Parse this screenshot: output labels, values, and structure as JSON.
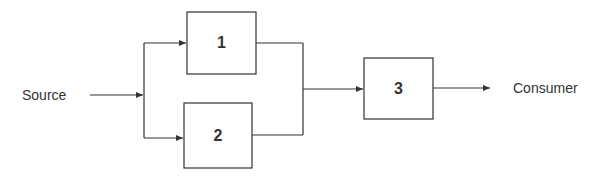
{
  "diagram": {
    "type": "block-diagram",
    "source_label": "Source",
    "consumer_label": "Consumer",
    "blocks": [
      {
        "id": "1",
        "label": "1"
      },
      {
        "id": "2",
        "label": "2"
      },
      {
        "id": "3",
        "label": "3"
      }
    ],
    "edges": [
      {
        "from": "Source",
        "to": "split"
      },
      {
        "from": "split",
        "to": "1"
      },
      {
        "from": "split",
        "to": "2"
      },
      {
        "from": "1",
        "to": "merge"
      },
      {
        "from": "2",
        "to": "merge"
      },
      {
        "from": "merge",
        "to": "3"
      },
      {
        "from": "3",
        "to": "Consumer"
      }
    ],
    "colors": {
      "stroke": "#333333",
      "background": "#ffffff"
    }
  }
}
